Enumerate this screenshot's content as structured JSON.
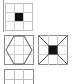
{
  "colors": {
    "grid_line": "#c8c8c8",
    "border": "#8a8a8a",
    "fill": "#111111",
    "diag": "#555555"
  },
  "tiles": [
    {
      "id": "question",
      "pattern": "grid-with-center-square",
      "x": 5,
      "y": 3,
      "w": 28,
      "h": 28
    },
    {
      "id": "option-1",
      "pattern": "grid-with-hexagon",
      "x": 5,
      "y": 36,
      "w": 28,
      "h": 28
    },
    {
      "id": "option-2",
      "pattern": "grid-with-center-square-and-diagonals",
      "x": 39,
      "y": 36,
      "w": 28,
      "h": 28
    },
    {
      "id": "option-3",
      "pattern": "grid-plain",
      "x": 5,
      "y": 69,
      "w": 28,
      "h": 28
    }
  ]
}
